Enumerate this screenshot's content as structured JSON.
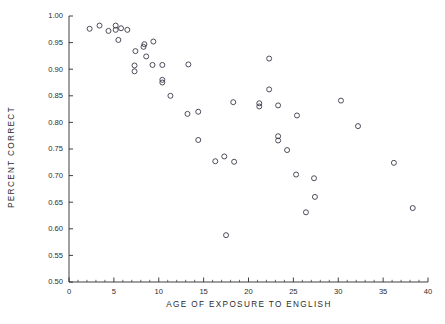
{
  "chart_data": {
    "type": "scatter",
    "title": "",
    "xlabel": "AGE OF EXPOSURE TO ENGLISH",
    "ylabel": "PERCENT CORRECT",
    "xlim": [
      0,
      40
    ],
    "ylim": [
      0.5,
      1.0
    ],
    "xticks": [
      0,
      5,
      10,
      15,
      20,
      25,
      30,
      35,
      40
    ],
    "xtick_labels": [
      "0",
      "5",
      "10",
      "15",
      "20",
      "25",
      "30",
      "35",
      "40"
    ],
    "xminor_tick_interval": 1,
    "yticks": [
      0.5,
      0.55,
      0.6,
      0.65,
      0.7,
      0.75,
      0.8,
      0.85,
      0.9,
      0.95,
      1.0
    ],
    "ytick_labels": [
      "0.50",
      "0.55",
      "0.60",
      "0.65",
      "0.70",
      "0.75",
      "0.80",
      "0.85",
      "0.90",
      "0.95",
      "1.00"
    ],
    "grid": false,
    "legend": null,
    "marker": "open-circle",
    "marker_color": "#3a3a4a",
    "marker_radius": 2.5,
    "axis_color": "#2b2b2b",
    "background_color": "#ffffff",
    "points": [
      {
        "x": 2.3,
        "y": 0.976
      },
      {
        "x": 3.4,
        "y": 0.982
      },
      {
        "x": 4.4,
        "y": 0.972
      },
      {
        "x": 5.2,
        "y": 0.982
      },
      {
        "x": 5.2,
        "y": 0.974
      },
      {
        "x": 5.8,
        "y": 0.977
      },
      {
        "x": 6.5,
        "y": 0.974
      },
      {
        "x": 5.5,
        "y": 0.955
      },
      {
        "x": 7.4,
        "y": 0.934
      },
      {
        "x": 8.3,
        "y": 0.942
      },
      {
        "x": 8.4,
        "y": 0.947
      },
      {
        "x": 9.4,
        "y": 0.952
      },
      {
        "x": 8.6,
        "y": 0.924
      },
      {
        "x": 7.3,
        "y": 0.907
      },
      {
        "x": 7.3,
        "y": 0.896
      },
      {
        "x": 9.3,
        "y": 0.908
      },
      {
        "x": 10.4,
        "y": 0.908
      },
      {
        "x": 10.4,
        "y": 0.88
      },
      {
        "x": 10.4,
        "y": 0.875
      },
      {
        "x": 11.3,
        "y": 0.85
      },
      {
        "x": 13.3,
        "y": 0.909
      },
      {
        "x": 13.2,
        "y": 0.816
      },
      {
        "x": 14.4,
        "y": 0.82
      },
      {
        "x": 14.4,
        "y": 0.767
      },
      {
        "x": 16.3,
        "y": 0.727
      },
      {
        "x": 17.3,
        "y": 0.736
      },
      {
        "x": 18.4,
        "y": 0.726
      },
      {
        "x": 17.5,
        "y": 0.588
      },
      {
        "x": 18.3,
        "y": 0.838
      },
      {
        "x": 21.2,
        "y": 0.836
      },
      {
        "x": 21.2,
        "y": 0.83
      },
      {
        "x": 22.3,
        "y": 0.92
      },
      {
        "x": 22.3,
        "y": 0.862
      },
      {
        "x": 23.3,
        "y": 0.832
      },
      {
        "x": 23.3,
        "y": 0.774
      },
      {
        "x": 23.3,
        "y": 0.766
      },
      {
        "x": 24.3,
        "y": 0.748
      },
      {
        "x": 25.4,
        "y": 0.813
      },
      {
        "x": 25.3,
        "y": 0.702
      },
      {
        "x": 27.3,
        "y": 0.695
      },
      {
        "x": 27.4,
        "y": 0.66
      },
      {
        "x": 26.4,
        "y": 0.631
      },
      {
        "x": 30.3,
        "y": 0.841
      },
      {
        "x": 32.2,
        "y": 0.793
      },
      {
        "x": 36.2,
        "y": 0.724
      },
      {
        "x": 38.3,
        "y": 0.639
      }
    ]
  }
}
